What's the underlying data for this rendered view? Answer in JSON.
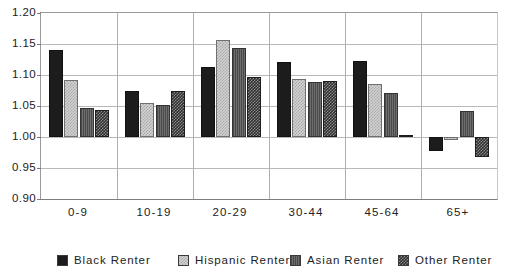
{
  "chart_data": {
    "type": "bar",
    "title": "",
    "subtitle": "",
    "xlabel": "",
    "ylabel": "",
    "categories": [
      "0-9",
      "10-19",
      "20-29",
      "30-44",
      "45-64",
      "65+"
    ],
    "series": [
      {
        "name": "Black  Renter",
        "pattern": "solid-black",
        "values": [
          1.141,
          1.074,
          1.113,
          1.121,
          1.123,
          0.978
        ]
      },
      {
        "name": "Hispanic  Renter",
        "pattern": "light-checker",
        "values": [
          1.092,
          1.055,
          1.157,
          1.093,
          1.086,
          0.995
        ]
      },
      {
        "name": "Asian  Renter",
        "pattern": "dark-vertical-hatch",
        "values": [
          1.046,
          1.052,
          1.144,
          1.088,
          1.071,
          1.042
        ]
      },
      {
        "name": "Other  Renter",
        "pattern": "dark-checker",
        "values": [
          1.044,
          1.074,
          1.097,
          1.09,
          1.001,
          0.967
        ]
      }
    ],
    "ylim": [
      0.9,
      1.2
    ],
    "yticks": [
      "1.20",
      "1.15",
      "1.10",
      "1.05",
      "1.00",
      "0.95",
      "0.90"
    ],
    "ytick_values": [
      1.2,
      1.15,
      1.1,
      1.05,
      1.0,
      0.95,
      0.9
    ],
    "baseline": 1.0,
    "grid": "horizontal-and-category-dividers",
    "legend_position": "bottom",
    "colors": {
      "black_renter": "#1c1c1c",
      "hispanic_renter": "#d2d2d2",
      "asian_renter": "#5a5a5a",
      "other_renter": "#2e2e2e",
      "gridline": "#b9b9b9",
      "axis": "#7d7d7d",
      "background": "#ffffff",
      "text": "#222222"
    }
  },
  "legend": {
    "items": [
      {
        "label": "Black  Renter"
      },
      {
        "label": "Hispanic  Renter"
      },
      {
        "label": "Asian  Renter"
      },
      {
        "label": "Other  Renter"
      }
    ]
  }
}
